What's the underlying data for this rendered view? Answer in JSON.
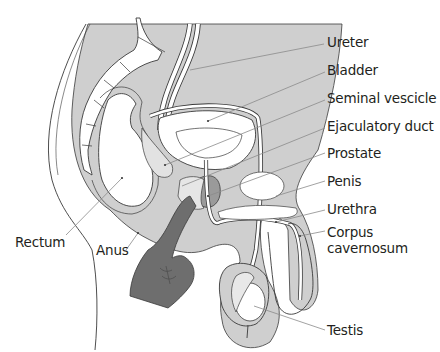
{
  "diagram": {
    "colors": {
      "tissue": "#cfcfcf",
      "tissue_dark": "#b8b8b8",
      "hand": "#6e6e6e",
      "prostate": "#9a9a9a",
      "outline": "#3a3a3a",
      "leader": "#8a8a8a",
      "background": "#ffffff"
    },
    "labels": [
      {
        "id": "ureter",
        "text": "Ureter"
      },
      {
        "id": "bladder",
        "text": "Bladder"
      },
      {
        "id": "seminal_vesicle",
        "text": "Seminal vescicle"
      },
      {
        "id": "ejaculatory_duct",
        "text": "Ejaculatory duct"
      },
      {
        "id": "prostate",
        "text": "Prostate"
      },
      {
        "id": "penis",
        "text": "Penis"
      },
      {
        "id": "urethra",
        "text": "Urethra"
      },
      {
        "id": "corpus_cavernosum_line1",
        "text": "Corpus"
      },
      {
        "id": "corpus_cavernosum_line2",
        "text": "cavernosum"
      },
      {
        "id": "testis",
        "text": "Testis"
      },
      {
        "id": "rectum",
        "text": "Rectum"
      },
      {
        "id": "anus",
        "text": "Anus"
      }
    ]
  }
}
